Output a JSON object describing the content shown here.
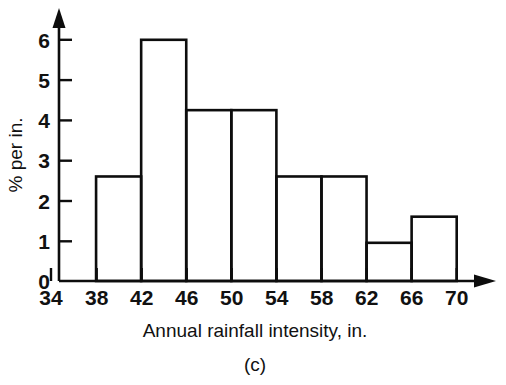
{
  "figure": {
    "caption": "(c)",
    "background_color": "#ffffff",
    "ink_color": "#0d0d0d"
  },
  "chart_data": {
    "type": "bar",
    "title": "",
    "subtitle": "",
    "xlabel": "Annual rainfall intensity, in.",
    "ylabel": "% per in.",
    "caption": "(c)",
    "grid": false,
    "legend": null,
    "legend_position": "none",
    "histogram": true,
    "bin_width": 4,
    "bin_edges": [
      34,
      38,
      42,
      46,
      50,
      54,
      58,
      62,
      66,
      70
    ],
    "categories": [
      "34-38",
      "38-42",
      "42-46",
      "46-50",
      "50-54",
      "54-58",
      "58-62",
      "62-66",
      "66-70"
    ],
    "values": [
      0,
      2.6,
      6.0,
      4.25,
      4.25,
      2.6,
      2.6,
      0.95,
      1.6
    ],
    "bars": [
      {
        "x0": 34,
        "x1": 38,
        "height": 0,
        "label": "34-38"
      },
      {
        "x0": 38,
        "x1": 42,
        "height": 2.6,
        "label": "38-42"
      },
      {
        "x0": 42,
        "x1": 46,
        "height": 6.0,
        "label": "42-46"
      },
      {
        "x0": 46,
        "x1": 50,
        "height": 4.25,
        "label": "46-50"
      },
      {
        "x0": 50,
        "x1": 54,
        "height": 4.25,
        "label": "50-54"
      },
      {
        "x0": 54,
        "x1": 58,
        "height": 2.6,
        "label": "54-58"
      },
      {
        "x0": 58,
        "x1": 62,
        "height": 2.6,
        "label": "58-62"
      },
      {
        "x0": 62,
        "x1": 66,
        "height": 0.95,
        "label": "62-66"
      },
      {
        "x0": 66,
        "x1": 70,
        "height": 1.6,
        "label": "66-70"
      }
    ],
    "xlim": [
      34,
      72
    ],
    "ylim": [
      0,
      6.6
    ],
    "xticks": [
      34,
      38,
      42,
      46,
      50,
      54,
      58,
      62,
      66,
      70
    ],
    "xtick_labels": [
      "34",
      "38",
      "42",
      "46",
      "50",
      "54",
      "58",
      "62",
      "66",
      "70"
    ],
    "yticks": [
      0,
      1,
      2,
      3,
      4,
      5,
      6
    ],
    "ytick_labels": [
      "0",
      "1",
      "2",
      "3",
      "4",
      "5",
      "6"
    ],
    "x_axis_arrow": true,
    "y_axis_arrow": true,
    "bar_fill": "none",
    "bar_stroke": "#0d0d0d"
  }
}
